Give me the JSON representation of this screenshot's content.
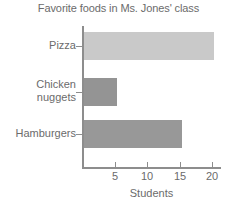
{
  "chart_data": {
    "type": "bar",
    "orientation": "horizontal",
    "title": "Favorite foods in Ms. Jones' class",
    "xlabel": "Students",
    "ylabel": "",
    "categories": [
      "Pizza",
      "Chicken nuggets",
      "Hamburgers"
    ],
    "values": [
      20,
      5,
      15
    ],
    "xlim": [
      0,
      21
    ],
    "xticks": [
      5,
      10,
      15,
      20
    ],
    "xtick_labels": [
      "5",
      "10",
      "15",
      "20"
    ],
    "grid": false,
    "legend": false,
    "bar_colors": [
      "#c9c9c9",
      "#949494",
      "#989898"
    ],
    "axis_color": "#8d8d8d",
    "text_color": "#6b6b6b",
    "background": "#ffffff",
    "bars": [
      {
        "label": "Pizza",
        "label_lines": "Pizza",
        "value": 20,
        "color": "#c9c9c9"
      },
      {
        "label": "Chicken nuggets",
        "label_lines": "Chicken\nnuggets",
        "value": 5,
        "color": "#949494"
      },
      {
        "label": "Hamburgers",
        "label_lines": "Hamburgers",
        "value": 15,
        "color": "#989898"
      }
    ]
  }
}
